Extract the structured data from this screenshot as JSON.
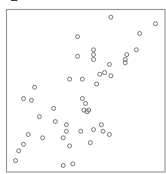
{
  "panel_label": "a",
  "chart_data": {
    "type": "scatter",
    "title": "",
    "xlabel": "",
    "ylabel": "",
    "xlim": [
      0,
      1
    ],
    "ylim": [
      0,
      1
    ],
    "grid": false,
    "legend": "none",
    "marker": "open-circle",
    "marker_color": "#555555",
    "frame_color": "#999999",
    "note": "No axis ticks shown; coordinates are normalized to the plot frame (0-1).",
    "points": [
      {
        "x": 0.66,
        "y": 0.95
      },
      {
        "x": 0.94,
        "y": 0.91
      },
      {
        "x": 0.45,
        "y": 0.83
      },
      {
        "x": 0.84,
        "y": 0.85
      },
      {
        "x": 0.45,
        "y": 0.71
      },
      {
        "x": 0.55,
        "y": 0.75
      },
      {
        "x": 0.55,
        "y": 0.72
      },
      {
        "x": 0.55,
        "y": 0.69
      },
      {
        "x": 0.76,
        "y": 0.72
      },
      {
        "x": 0.82,
        "y": 0.75
      },
      {
        "x": 0.75,
        "y": 0.69
      },
      {
        "x": 0.75,
        "y": 0.67
      },
      {
        "x": 0.65,
        "y": 0.66
      },
      {
        "x": 0.62,
        "y": 0.61
      },
      {
        "x": 0.59,
        "y": 0.6
      },
      {
        "x": 0.66,
        "y": 0.59
      },
      {
        "x": 0.4,
        "y": 0.57
      },
      {
        "x": 0.48,
        "y": 0.57
      },
      {
        "x": 0.57,
        "y": 0.54
      },
      {
        "x": 0.18,
        "y": 0.52
      },
      {
        "x": 0.11,
        "y": 0.45
      },
      {
        "x": 0.16,
        "y": 0.44
      },
      {
        "x": 0.48,
        "y": 0.45
      },
      {
        "x": 0.5,
        "y": 0.42
      },
      {
        "x": 0.3,
        "y": 0.39
      },
      {
        "x": 0.49,
        "y": 0.38
      },
      {
        "x": 0.51,
        "y": 0.37
      },
      {
        "x": 0.52,
        "y": 0.38
      },
      {
        "x": 0.21,
        "y": 0.34
      },
      {
        "x": 0.31,
        "y": 0.31
      },
      {
        "x": 0.38,
        "y": 0.29
      },
      {
        "x": 0.6,
        "y": 0.29
      },
      {
        "x": 0.38,
        "y": 0.25
      },
      {
        "x": 0.47,
        "y": 0.25
      },
      {
        "x": 0.55,
        "y": 0.26
      },
      {
        "x": 0.61,
        "y": 0.25
      },
      {
        "x": 0.65,
        "y": 0.23
      },
      {
        "x": 0.14,
        "y": 0.23
      },
      {
        "x": 0.23,
        "y": 0.21
      },
      {
        "x": 0.36,
        "y": 0.21
      },
      {
        "x": 0.53,
        "y": 0.18
      },
      {
        "x": 0.11,
        "y": 0.17
      },
      {
        "x": 0.4,
        "y": 0.16
      },
      {
        "x": 0.08,
        "y": 0.13
      },
      {
        "x": 0.06,
        "y": 0.07
      },
      {
        "x": 0.36,
        "y": 0.04
      },
      {
        "x": 0.42,
        "y": 0.05
      }
    ]
  }
}
